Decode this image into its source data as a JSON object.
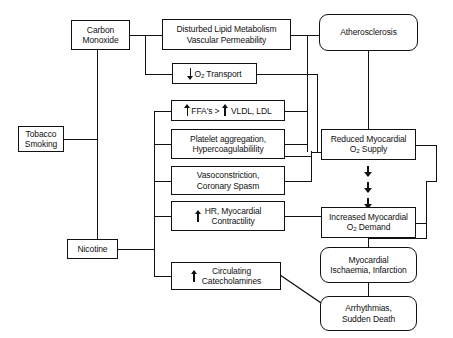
{
  "diagram": {
    "type": "flowchart",
    "line_color": "#111111",
    "background": "#ffffff"
  },
  "nodes": {
    "tobacco_smoking": {
      "id": "tobacco-smoking",
      "line1": "Tobacco",
      "line2": "Smoking",
      "shape": "rect"
    },
    "carbon_monoxide": {
      "id": "carbon-monoxide",
      "line1": "Carbon",
      "line2": "Monoxide",
      "shape": "rect"
    },
    "nicotine": {
      "id": "nicotine",
      "line1": "Nicotine",
      "line2": "",
      "shape": "rect"
    },
    "lipid_metabolism": {
      "id": "disturbed-lipid-metabolism",
      "line1": "Disturbed Lipid Metabolism",
      "line2": "Vascular Permeability",
      "shape": "rect"
    },
    "o2_transport": {
      "id": "o2-transport",
      "arrow": "down",
      "line1_a": "O",
      "line1_sub": "2",
      "line1_b": " Transport",
      "shape": "rect"
    },
    "ffa": {
      "id": "ffa-vldl-ldl",
      "arrow": "up",
      "line1_a": "FFA's > ",
      "arrow2": "up",
      "line1_b": " VLDL, LDL",
      "shape": "rect"
    },
    "platelet": {
      "id": "platelet-aggregation",
      "line1": "Platelet aggregation,",
      "line2": "Hypercoagulabilility",
      "shape": "rect"
    },
    "vasoconstriction": {
      "id": "vasoconstriction",
      "line1": "Vasoconstriction,",
      "line2": "Coronary Spasm",
      "shape": "rect"
    },
    "hr_contractility": {
      "id": "hr-myocardial-contractility",
      "arrow": "up",
      "line1": "HR, Myocardial",
      "line2": "Contractility",
      "shape": "rect"
    },
    "catecholamines": {
      "id": "circulating-catecholamines",
      "arrow": "up",
      "line1": "Circulating",
      "line2": "Catecholamines",
      "shape": "rect"
    },
    "atherosclerosis": {
      "id": "atherosclerosis",
      "line1": "Atherosclerosis",
      "line2": "",
      "shape": "rounded"
    },
    "reduced_supply": {
      "id": "reduced-myocardial-o2-supply",
      "line1": "Reduced Myocardial",
      "line2_a": "O",
      "line2_sub": "2",
      "line2_b": " Supply",
      "shape": "rect"
    },
    "increased_demand": {
      "id": "increased-myocardial-o2-demand",
      "line1": "Increased Myocardial",
      "line2_a": "O",
      "line2_sub": "2",
      "line2_b": " Demand",
      "shape": "rect"
    },
    "ischaemia": {
      "id": "myocardial-ischaemia-infarction",
      "line1": "Myocardial",
      "line2": "Ischaemia, Infarction",
      "shape": "rounded"
    },
    "arrhythmias": {
      "id": "arrhythmias-sudden-death",
      "line1": "Arrhythmias,",
      "line2": "Sudden Death",
      "shape": "rounded"
    }
  },
  "edges": [
    {
      "from": "tobacco_smoking",
      "to": "carbon_monoxide"
    },
    {
      "from": "tobacco_smoking",
      "to": "nicotine"
    },
    {
      "from": "carbon_monoxide",
      "to": "lipid_metabolism"
    },
    {
      "from": "carbon_monoxide",
      "to": "o2_transport"
    },
    {
      "from": "nicotine",
      "to": "ffa"
    },
    {
      "from": "nicotine",
      "to": "platelet"
    },
    {
      "from": "nicotine",
      "to": "vasoconstriction"
    },
    {
      "from": "nicotine",
      "to": "hr_contractility"
    },
    {
      "from": "nicotine",
      "to": "catecholamines"
    },
    {
      "from": "lipid_metabolism",
      "to": "atherosclerosis"
    },
    {
      "from": "ffa",
      "to": "atherosclerosis"
    },
    {
      "from": "platelet",
      "to": "atherosclerosis"
    },
    {
      "from": "atherosclerosis",
      "to": "reduced_supply"
    },
    {
      "from": "o2_transport",
      "to": "reduced_supply"
    },
    {
      "from": "platelet",
      "to": "reduced_supply"
    },
    {
      "from": "vasoconstriction",
      "to": "reduced_supply"
    },
    {
      "from": "hr_contractility",
      "to": "increased_demand"
    },
    {
      "from": "reduced_supply",
      "to": "increased_demand",
      "style": "triple-arrow"
    },
    {
      "from": "reduced_supply",
      "to": "ischaemia"
    },
    {
      "from": "increased_demand",
      "to": "ischaemia"
    },
    {
      "from": "ischaemia",
      "to": "arrhythmias"
    },
    {
      "from": "catecholamines",
      "to": "arrhythmias",
      "style": "diagonal"
    }
  ]
}
